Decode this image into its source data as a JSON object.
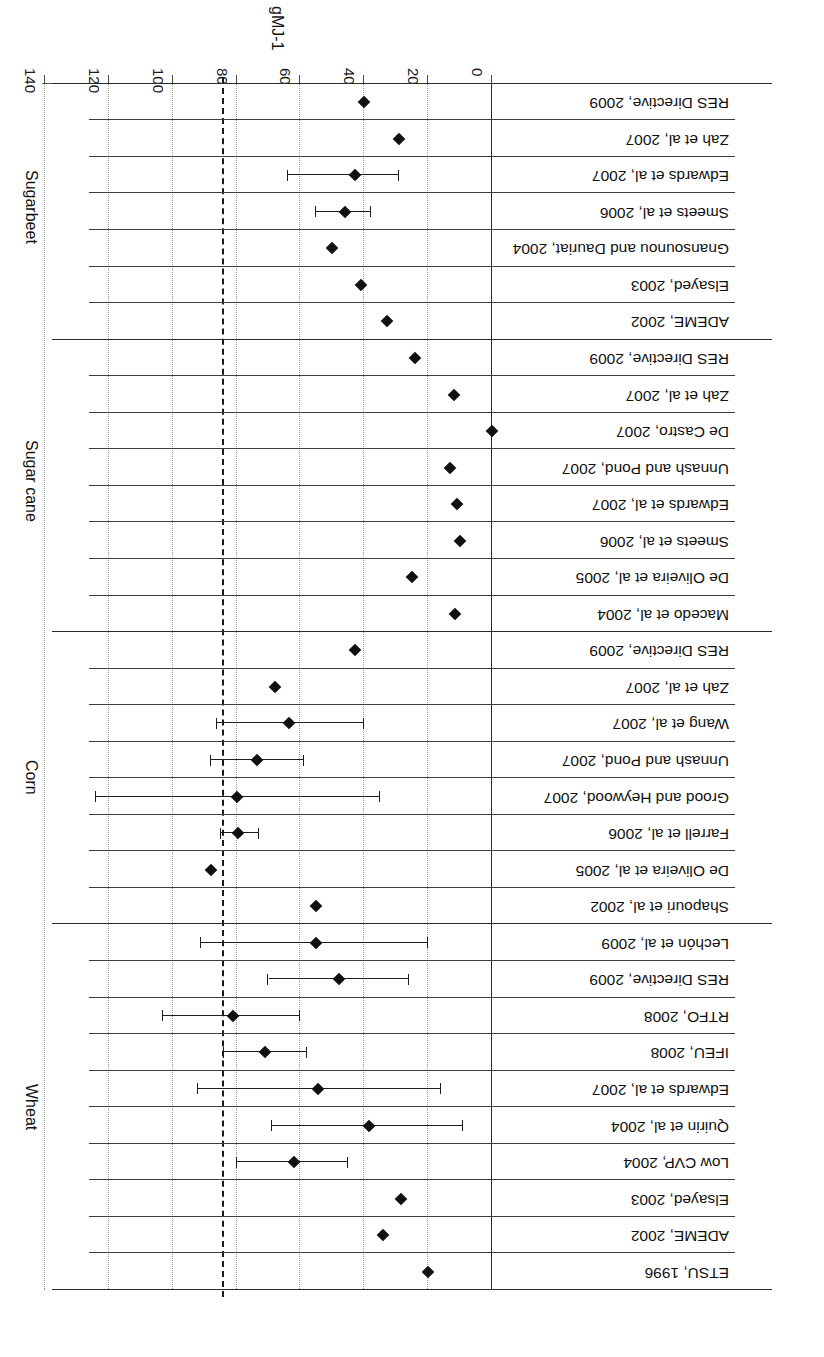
{
  "figure": {
    "orientation_note": "rotated-180",
    "axis_title": "gMJ-1",
    "marker_color": "#111111",
    "reference_line_value": 84,
    "reference_line_style": "dashed"
  },
  "chart_data": {
    "type": "scatter",
    "title": "",
    "subtitle": "",
    "xlabel": "gMJ-1",
    "ylabel": "",
    "xlim": [
      0,
      140
    ],
    "xticks": [
      0,
      20,
      40,
      60,
      80,
      100,
      120,
      140
    ],
    "xticklabels": [
      "0",
      "20",
      "40",
      "60",
      "80",
      "100",
      "120",
      "140"
    ],
    "grid": "vertical-dotted-at-xticks",
    "legend": "none",
    "annotations": [
      {
        "type": "vline",
        "value": 84,
        "style": "dashed"
      }
    ],
    "groups": [
      {
        "name": "Wheat",
        "points": [
          {
            "label": "ETSU, 1996",
            "value": 20,
            "low": null,
            "high": null
          },
          {
            "label": "ADEME, 2002",
            "value": 34,
            "low": null,
            "high": null
          },
          {
            "label": "Elsayed, 2003",
            "value": 28.5,
            "low": null,
            "high": null
          },
          {
            "label": "Low CVP, 2004",
            "value": 62,
            "low": 45,
            "high": 80
          },
          {
            "label": "Quirin et al, 2004",
            "value": 38.5,
            "low": 9,
            "high": 69
          },
          {
            "label": "Edwards et al, 2007",
            "value": 54.5,
            "low": 16,
            "high": 92
          },
          {
            "label": "IFEU, 2008",
            "value": 71,
            "low": 58,
            "high": 84
          },
          {
            "label": "RTFO, 2008",
            "value": 81,
            "low": 60,
            "high": 103
          },
          {
            "label": "RES Directive, 2009",
            "value": 48,
            "low": 26,
            "high": 70
          },
          {
            "label": "Lechón et al, 2009",
            "value": 55,
            "low": 20,
            "high": 91
          }
        ]
      },
      {
        "name": "Corn",
        "points": [
          {
            "label": "Shapouri et al, 2002",
            "value": 55,
            "low": null,
            "high": null
          },
          {
            "label": "De Oliveira et al, 2005",
            "value": 88,
            "low": null,
            "high": null
          },
          {
            "label": "Farrell et al, 2006",
            "value": 79.5,
            "low": 73,
            "high": 85
          },
          {
            "label": "Grood and Heywood, 2007",
            "value": 80,
            "low": 35,
            "high": 124
          },
          {
            "label": "Unnash and Pond, 2007",
            "value": 73.5,
            "low": 59,
            "high": 88
          },
          {
            "label": "Wang et al, 2007",
            "value": 63.5,
            "low": 40,
            "high": 86
          },
          {
            "label": "Zah et al, 2007",
            "value": 68,
            "low": null,
            "high": null
          },
          {
            "label": "RES Directive, 2009",
            "value": 43,
            "low": null,
            "high": null
          }
        ]
      },
      {
        "name": "Sugar cane",
        "points": [
          {
            "label": "Macedo et al, 2004",
            "value": 11.5,
            "low": null,
            "high": null
          },
          {
            "label": "De Oliveira et al, 2005",
            "value": 25,
            "low": null,
            "high": null
          },
          {
            "label": "Smeets et al, 2006",
            "value": 10,
            "low": null,
            "high": null
          },
          {
            "label": "Edwards et al,  2007",
            "value": 11,
            "low": null,
            "high": null
          },
          {
            "label": "Unnash and Pond, 2007",
            "value": 13,
            "low": null,
            "high": null
          },
          {
            "label": "De Castro, 2007",
            "value": 0,
            "low": null,
            "high": null
          },
          {
            "label": "Zah et al, 2007",
            "value": 12,
            "low": null,
            "high": null
          },
          {
            "label": "RES Directive, 2009",
            "value": 24,
            "low": null,
            "high": null
          }
        ]
      },
      {
        "name": "Sugarbeet",
        "points": [
          {
            "label": "ADEME, 2002",
            "value": 33,
            "low": null,
            "high": null
          },
          {
            "label": "Elsayed, 2003",
            "value": 41,
            "low": null,
            "high": null
          },
          {
            "label": "Gnansounou and Dauriat, 2004",
            "value": 50,
            "low": null,
            "high": null
          },
          {
            "label": "Smeets et al, 2006",
            "value": 46,
            "low": 38,
            "high": 55
          },
          {
            "label": "Edwards et al, 2007",
            "value": 43,
            "low": 29,
            "high": 64
          },
          {
            "label": "Zah et al, 2007",
            "value": 29,
            "low": null,
            "high": null
          },
          {
            "label": "RES Directive, 2009",
            "value": 40,
            "low": null,
            "high": null
          }
        ]
      }
    ]
  }
}
